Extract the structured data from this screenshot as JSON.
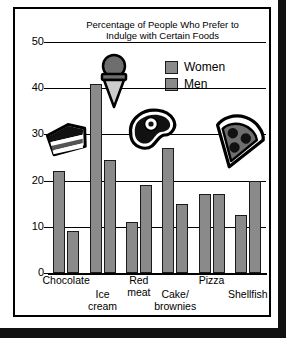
{
  "chart_data": {
    "type": "bar",
    "title": "Percentage of People Who Prefer to Indulge with Certain Foods",
    "title_line1": "Percentage of People Who Prefer to",
    "title_line2": "Indulge with Certain Foods",
    "xlabel": "",
    "ylabel": "",
    "ylim": [
      0,
      50
    ],
    "yticks": [
      0,
      10,
      20,
      30,
      40,
      50
    ],
    "ytick_labels": [
      "0",
      "10",
      "20",
      "30",
      "40",
      "50"
    ],
    "grid": true,
    "legend_position": "top-right",
    "categories": [
      "Chocolate",
      "Ice cream",
      "Red meat",
      "Cake/brownies",
      "Pizza",
      "Shellfish"
    ],
    "category_labels": [
      "Chocolate",
      "Ice\ncream",
      "Red\nmeat",
      "Cake/\nbrownies",
      "Pizza",
      "Shellfish"
    ],
    "series": [
      {
        "name": "Women",
        "values": [
          22,
          41,
          11,
          27,
          17,
          12.5
        ],
        "color": "#8a8a8a"
      },
      {
        "name": "Men",
        "values": [
          9,
          24.5,
          19,
          15,
          17,
          20
        ],
        "color": "#8a8a8a"
      }
    ],
    "icons": [
      {
        "name": "chocolate-cake-icon",
        "category": "Chocolate"
      },
      {
        "name": "ice-cream-cone-icon",
        "category": "Ice cream"
      },
      {
        "name": "steak-icon",
        "category": "Red meat"
      },
      {
        "name": "pizza-slice-icon",
        "category": "Pizza"
      }
    ]
  },
  "colors": {
    "bar_fill": "#8a8a8a",
    "bar_stroke": "#1a1a1a",
    "axis": "#000000",
    "background": "#ffffff"
  }
}
